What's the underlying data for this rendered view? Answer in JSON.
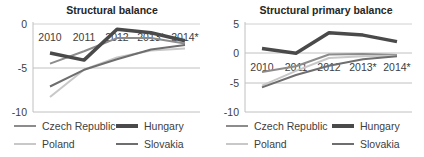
{
  "chart_data": [
    {
      "type": "line",
      "title": "Structural balance",
      "xlabel": "",
      "ylabel": "",
      "categories": [
        "2010",
        "2011",
        "2012",
        "2013*",
        "2014*"
      ],
      "ylim": [
        -10,
        0
      ],
      "yticks": [
        "0",
        "-5",
        "-10"
      ],
      "grid": true,
      "legend_position": "bottom",
      "series": [
        {
          "name": "Czech Republic",
          "color": "#8c8c8c",
          "width": 2,
          "values": [
            -4.5,
            -3.1,
            -1.6,
            -1.6,
            -2.2
          ]
        },
        {
          "name": "Hungary",
          "color": "#4a4a4a",
          "width": 3.5,
          "values": [
            -3.3,
            -4.1,
            -0.6,
            -1.0,
            -1.9
          ]
        },
        {
          "name": "Poland",
          "color": "#c8c8c8",
          "width": 2,
          "values": [
            -8.3,
            -5.2,
            -3.8,
            -3.0,
            -2.8
          ]
        },
        {
          "name": "Slovakia",
          "color": "#6e6e6e",
          "width": 2,
          "values": [
            -7.1,
            -5.2,
            -4.0,
            -2.9,
            -2.4
          ]
        }
      ]
    },
    {
      "type": "line",
      "title": "Structural primary balance",
      "xlabel": "",
      "ylabel": "",
      "categories": [
        "2010",
        "2011",
        "2012",
        "2013*",
        "2014*"
      ],
      "ylim": [
        -10,
        5
      ],
      "yticks": [
        "5",
        "0",
        "-5",
        "-10"
      ],
      "grid": true,
      "legend_position": "bottom",
      "series": [
        {
          "name": "Czech Republic",
          "color": "#8c8c8c",
          "width": 2,
          "values": [
            -3.2,
            -2.2,
            -0.2,
            -0.1,
            -0.3
          ]
        },
        {
          "name": "Hungary",
          "color": "#4a4a4a",
          "width": 3.5,
          "values": [
            0.8,
            0.0,
            3.5,
            3.1,
            2.0
          ]
        },
        {
          "name": "Poland",
          "color": "#c8c8c8",
          "width": 2,
          "values": [
            -5.5,
            -3.0,
            -0.8,
            -0.5,
            -0.4
          ]
        },
        {
          "name": "Slovakia",
          "color": "#6e6e6e",
          "width": 2,
          "values": [
            -5.8,
            -3.7,
            -2.1,
            -1.0,
            -0.5
          ]
        }
      ]
    }
  ],
  "charts": [
    {
      "title": "Structural balance",
      "categories": [
        "2010",
        "2011",
        "2012",
        "2013*",
        "2014*"
      ],
      "yticks": [
        "0",
        "-5",
        "-10"
      ],
      "legend": [
        "Czech Republic",
        "Hungary",
        "Poland",
        "Slovakia"
      ]
    },
    {
      "title": "Structural primary balance",
      "categories": [
        "2010",
        "2011",
        "2012",
        "2013*",
        "2014*"
      ],
      "yticks": [
        "5",
        "0",
        "-5",
        "-10"
      ],
      "legend": [
        "Czech Republic",
        "Hungary",
        "Poland",
        "Slovakia"
      ]
    }
  ]
}
